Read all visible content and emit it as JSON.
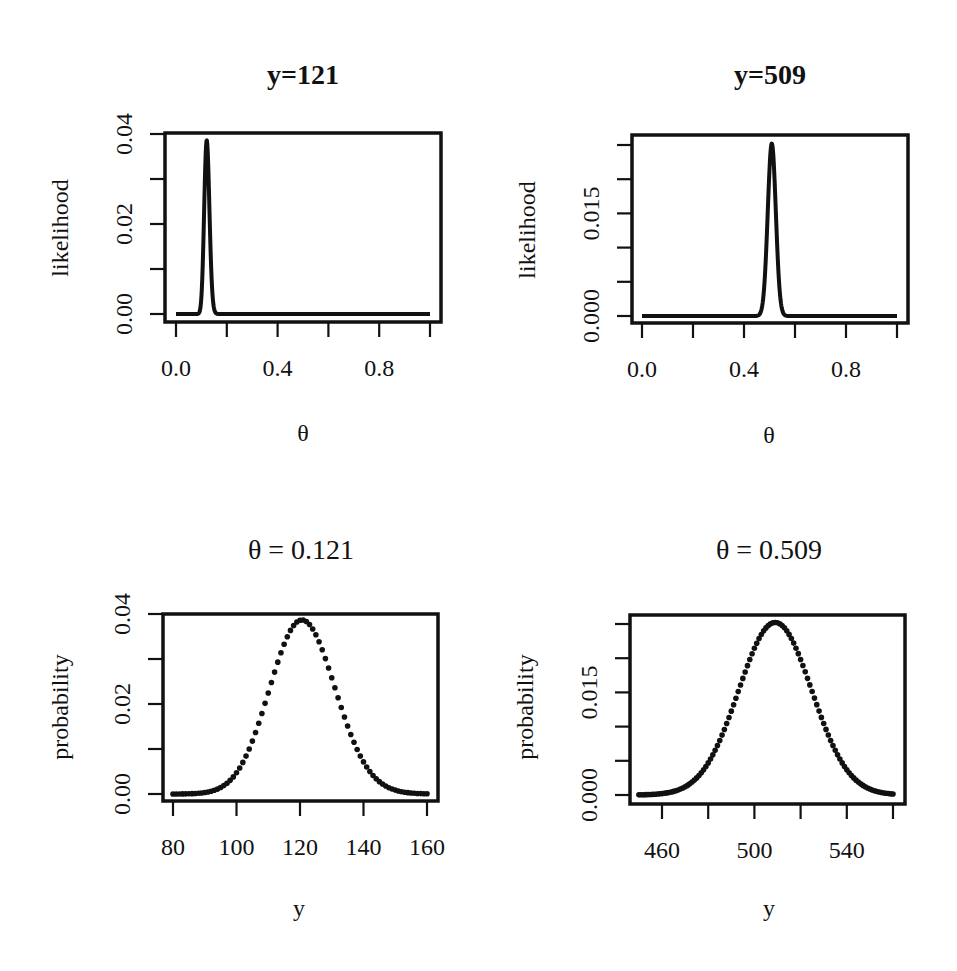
{
  "figure": {
    "background": "#ffffff",
    "ink_color": "#111111"
  },
  "chart_data": [
    {
      "id": "panel-top-left",
      "type": "line",
      "title": "y=121",
      "title_bold": true,
      "xlabel": "θ",
      "ylabel": "likelihood",
      "xlim": [
        0,
        1
      ],
      "ylim": [
        0,
        0.04
      ],
      "x_ticks": [
        0,
        0.2,
        0.4,
        0.6,
        0.8,
        1.0
      ],
      "x_tick_labels": [
        "0.0",
        "",
        "0.4",
        "",
        "0.8",
        ""
      ],
      "y_ticks": [
        0,
        0.01,
        0.02,
        0.03,
        0.04
      ],
      "y_tick_labels": [
        "0.00",
        "",
        "0.02",
        "",
        "0.04"
      ],
      "model": {
        "kind": "binomial_likelihood",
        "n": 1000,
        "y": 121,
        "x_from": 0,
        "x_to": 1
      },
      "peak": {
        "x": 0.121,
        "y": 0.0387
      },
      "x": [
        0.0,
        0.08,
        0.1,
        0.11,
        0.121,
        0.13,
        0.14,
        0.16,
        0.2,
        0.4,
        0.6,
        0.8,
        1.0
      ],
      "values": [
        0.0,
        2e-05,
        0.0068,
        0.0277,
        0.0387,
        0.0302,
        0.0107,
        0.0001,
        0.0,
        0.0,
        0.0,
        0.0,
        0.0
      ],
      "frame": {
        "left": 165,
        "top": 133,
        "right": 441,
        "bottom": 322
      },
      "x_px": [
        176,
        430
      ],
      "y_px": [
        314,
        134
      ]
    },
    {
      "id": "panel-top-right",
      "type": "line",
      "title": "y=509",
      "title_bold": true,
      "xlabel": "θ",
      "ylabel": "likelihood",
      "xlim": [
        0,
        1
      ],
      "ylim": [
        0,
        0.025
      ],
      "x_ticks": [
        0,
        0.2,
        0.4,
        0.6,
        0.8,
        1.0
      ],
      "x_tick_labels": [
        "0.0",
        "",
        "0.4",
        "",
        "0.8",
        ""
      ],
      "y_ticks": [
        0,
        0.005,
        0.01,
        0.015,
        0.02,
        0.025
      ],
      "y_tick_labels": [
        "0.000",
        "",
        "",
        "0.015",
        "",
        ""
      ],
      "model": {
        "kind": "binomial_likelihood",
        "n": 1000,
        "y": 509,
        "x_from": 0,
        "x_to": 1
      },
      "peak": {
        "x": 0.509,
        "y": 0.0252
      },
      "x": [
        0.0,
        0.2,
        0.4,
        0.46,
        0.48,
        0.5,
        0.509,
        0.52,
        0.54,
        0.56,
        0.6,
        0.8,
        1.0
      ],
      "values": [
        0.0,
        0.0,
        0.0,
        0.0002,
        0.0039,
        0.0211,
        0.0252,
        0.0197,
        0.0034,
        0.0001,
        0.0,
        0.0,
        0.0
      ],
      "frame": {
        "left": 632,
        "top": 135,
        "right": 908,
        "bottom": 323
      },
      "x_px": [
        642,
        897
      ],
      "y_px": [
        316,
        145
      ]
    },
    {
      "id": "panel-bottom-left",
      "type": "scatter",
      "title": "θ = 0.121",
      "title_bold": false,
      "xlabel": "y",
      "ylabel": "probability",
      "xlim": [
        80,
        160
      ],
      "ylim": [
        0,
        0.04
      ],
      "x_ticks": [
        80,
        100,
        120,
        140,
        160
      ],
      "x_tick_labels": [
        "80",
        "100",
        "120",
        "140",
        "160"
      ],
      "y_ticks": [
        0,
        0.01,
        0.02,
        0.03,
        0.04
      ],
      "y_tick_labels": [
        "0.00",
        "",
        "0.02",
        "",
        "0.04"
      ],
      "model": {
        "kind": "binomial_pmf",
        "n": 1000,
        "theta": 0.121,
        "x_from": 80,
        "x_to": 160,
        "step": 1
      },
      "peak": {
        "x": 121,
        "y": 0.0387
      },
      "x": [
        80,
        90,
        100,
        105,
        110,
        115,
        121,
        125,
        130,
        135,
        140,
        150,
        160
      ],
      "values": [
        4e-05,
        0.0009,
        0.0061,
        0.0132,
        0.0232,
        0.0334,
        0.0387,
        0.0358,
        0.0267,
        0.0157,
        0.0072,
        0.0007,
        4e-05
      ],
      "frame": {
        "left": 163,
        "top": 614,
        "right": 438,
        "bottom": 801
      },
      "x_px": [
        173,
        427
      ],
      "y_px": [
        794,
        614
      ]
    },
    {
      "id": "panel-bottom-right",
      "type": "scatter",
      "title": "θ = 0.509",
      "title_bold": false,
      "xlabel": "y",
      "ylabel": "probability",
      "xlim": [
        450,
        560
      ],
      "ylim": [
        0,
        0.025
      ],
      "x_ticks": [
        460,
        480,
        500,
        520,
        540,
        560
      ],
      "x_tick_labels": [
        "460",
        "",
        "500",
        "",
        "540",
        ""
      ],
      "y_ticks": [
        0,
        0.005,
        0.01,
        0.015,
        0.02,
        0.025
      ],
      "y_tick_labels": [
        "0.000",
        "",
        "",
        "0.015",
        "",
        ""
      ],
      "model": {
        "kind": "binomial_pmf",
        "n": 1000,
        "theta": 0.509,
        "x_from": 450,
        "x_to": 560,
        "step": 1
      },
      "peak": {
        "x": 509,
        "y": 0.0252
      },
      "x": [
        450,
        460,
        470,
        480,
        490,
        500,
        509,
        520,
        530,
        540,
        550,
        560
      ],
      "values": [
        0.0002,
        0.0012,
        0.0047,
        0.0118,
        0.0196,
        0.0242,
        0.0252,
        0.0198,
        0.0105,
        0.0038,
        0.0009,
        0.0001
      ],
      "frame": {
        "left": 630,
        "top": 615,
        "right": 905,
        "bottom": 804
      },
      "x_px": [
        662,
        893
      ],
      "y_px": [
        795,
        624
      ]
    }
  ]
}
